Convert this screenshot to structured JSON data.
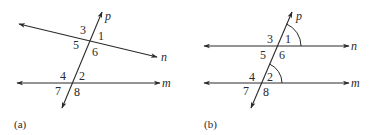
{
  "figure": {
    "panel_a": {
      "caption": "(a)",
      "lines": {
        "p": "p",
        "n": "n",
        "m": "m"
      },
      "angles": [
        "1",
        "2",
        "3",
        "4",
        "5",
        "6",
        "7",
        "8"
      ]
    },
    "panel_b": {
      "caption": "(b)",
      "lines": {
        "p": "p",
        "n": "n",
        "m": "m"
      },
      "angles": [
        "1",
        "2",
        "3",
        "4",
        "5",
        "6",
        "7",
        "8"
      ],
      "marked_angles": [
        "1",
        "2"
      ]
    },
    "colors": {
      "ink": "#2a2a2a",
      "background": "#ffffff"
    }
  }
}
